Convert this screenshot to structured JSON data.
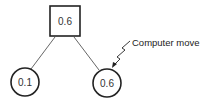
{
  "diagram": {
    "type": "game-tree",
    "root": {
      "shape": "square",
      "value": "0.6"
    },
    "children": [
      {
        "shape": "circle",
        "value": "0.1"
      },
      {
        "shape": "circle",
        "value": "0.6"
      }
    ],
    "annotation": {
      "text": "Computer move",
      "points_to": "right-child"
    }
  }
}
